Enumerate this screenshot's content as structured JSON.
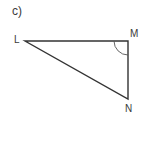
{
  "figure": {
    "part_label": "c)",
    "vertices": {
      "L": {
        "label": "L",
        "x": 25,
        "y": 41
      },
      "M": {
        "label": "M",
        "x": 128,
        "y": 41
      },
      "N": {
        "label": "N",
        "x": 128,
        "y": 99
      }
    },
    "right_angle_marker": {
      "vertex": "M",
      "style": "arc"
    },
    "colors": {
      "stroke": "#333333",
      "text": "#3a3a3a",
      "background": "#ffffff"
    }
  }
}
